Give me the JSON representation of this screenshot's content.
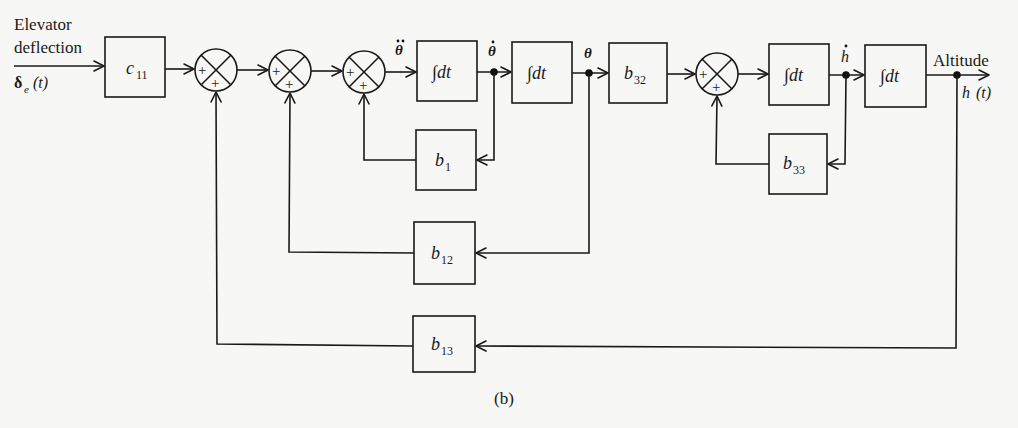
{
  "input": {
    "label_line1": "Elevator",
    "label_line2": "deflection",
    "signal": "δ",
    "signal_sub": "e",
    "signal_arg": "(t)"
  },
  "blocks": {
    "c11": {
      "main": "c",
      "sub": "11"
    },
    "int1": {
      "main": "∫dt"
    },
    "int2": {
      "main": "∫dt"
    },
    "b32": {
      "main": "b",
      "sub": "32"
    },
    "int3": {
      "main": "∫dt"
    },
    "int4": {
      "main": "∫dt"
    },
    "b1": {
      "main": "b",
      "sub": "1"
    },
    "b12": {
      "main": "b",
      "sub": "12"
    },
    "b13": {
      "main": "b",
      "sub": "13"
    },
    "b33": {
      "main": "b",
      "sub": "33"
    }
  },
  "summers": {
    "sign_left": "+",
    "sign_bottom": "+"
  },
  "signals": {
    "theta_ddot": "θ",
    "theta_dot": "θ",
    "theta": "θ",
    "h_dot": "h"
  },
  "output": {
    "label": "Altitude",
    "signal": "h",
    "signal_arg": "(t)"
  },
  "caption": "(b)"
}
